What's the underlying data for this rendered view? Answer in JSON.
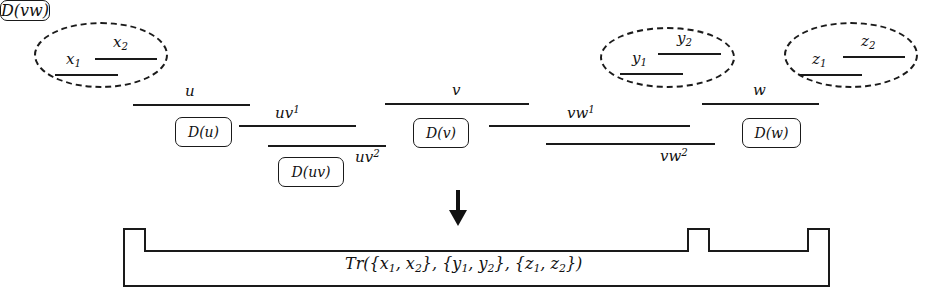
{
  "diagram": {
    "arrow_glyph": "↓",
    "groups": [
      {
        "name": "x-group",
        "members": [
          {
            "label": "x",
            "sub": "1"
          },
          {
            "label": "x",
            "sub": "2"
          }
        ]
      },
      {
        "name": "y-group",
        "members": [
          {
            "label": "y",
            "sub": "1"
          },
          {
            "label": "y",
            "sub": "2"
          }
        ]
      },
      {
        "name": "z-group",
        "members": [
          {
            "label": "z",
            "sub": "1"
          },
          {
            "label": "z",
            "sub": "2"
          }
        ]
      }
    ],
    "segments": [
      {
        "name": "u",
        "label": "u",
        "sup": ""
      },
      {
        "name": "uv1",
        "label": "uv",
        "sup": "1"
      },
      {
        "name": "uv2",
        "label": "uv",
        "sup": "2"
      },
      {
        "name": "v",
        "label": "v",
        "sup": ""
      },
      {
        "name": "vw1",
        "label": "vw",
        "sup": "1"
      },
      {
        "name": "vw2",
        "label": "vw",
        "sup": "2"
      },
      {
        "name": "w",
        "label": "w",
        "sup": ""
      }
    ],
    "dictionary_boxes": [
      {
        "name": "D-u",
        "text": "D(u)"
      },
      {
        "name": "D-uv",
        "text": "D(uv)"
      },
      {
        "name": "D-v",
        "text": "D(v)"
      },
      {
        "name": "D-vw",
        "text": "D(vw)"
      },
      {
        "name": "D-w",
        "text": "D(w)"
      }
    ],
    "result": {
      "prefix": "Tr({x",
      "full_text": "Tr({x1, x2}, {y1, y2}, {z1, z2})",
      "parts": [
        "Tr({x",
        "1",
        ", x",
        "2",
        "}, {y",
        "1",
        ", y",
        "2",
        "}, {z",
        "1",
        ", z",
        "2",
        "})"
      ]
    },
    "colors": {
      "ink": "#1a1a1a",
      "background": "#ffffff"
    }
  }
}
